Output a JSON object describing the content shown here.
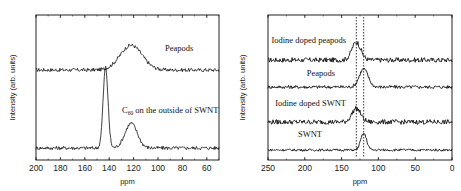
{
  "chart_data": [
    {
      "type": "line",
      "title": "",
      "xlabel": "ppm",
      "ylabel": "Intensity (arb. units)",
      "xlim": [
        200,
        50
      ],
      "x_reversed": true,
      "xticks": [
        200,
        180,
        160,
        140,
        120,
        100,
        80,
        60
      ],
      "xtick_labels": [
        "200",
        "180",
        "160",
        "140",
        "120",
        "100",
        "80",
        "60"
      ],
      "grid": false,
      "legend": "none (inline series labels)",
      "series": [
        {
          "name": "Peapods",
          "label": "Peapods",
          "offset": 1,
          "peaks": [
            {
              "ppm": 122,
              "height": 0.55,
              "width": 9
            }
          ],
          "noise": 0.05
        },
        {
          "name": "C60 on the outside of SWNT",
          "label_main": "C",
          "label_sub": "60",
          "label_rest": " on the outside of SWNT",
          "offset": 0,
          "peaks": [
            {
              "ppm": 143,
              "height": 1.8,
              "width": 2
            },
            {
              "ppm": 122,
              "height": 0.55,
              "width": 5
            }
          ],
          "noise": 0.05
        }
      ]
    },
    {
      "type": "line",
      "title": "",
      "xlabel": "ppm",
      "ylabel": "Intensity (arb. units)",
      "xlim": [
        250,
        0
      ],
      "x_reversed": true,
      "xticks": [
        250,
        200,
        150,
        100,
        50,
        0
      ],
      "xtick_labels": [
        "250",
        "200",
        "150",
        "100",
        "50",
        "0"
      ],
      "grid": false,
      "legend": "none (inline series labels)",
      "reference_lines": [
        {
          "ppm": 130,
          "style": "dotted"
        },
        {
          "ppm": 120,
          "style": "dotted"
        }
      ],
      "series": [
        {
          "name": "Iodine doped peapods",
          "label": "Iodine doped peapods",
          "offset": 3,
          "peaks": [
            {
              "ppm": 130,
              "height": 0.6,
              "width": 6
            }
          ],
          "noise": 0.1
        },
        {
          "name": "Peapods",
          "label": "Peapods",
          "offset": 2,
          "peaks": [
            {
              "ppm": 120,
              "height": 0.6,
              "width": 6
            }
          ],
          "noise": 0.07
        },
        {
          "name": "Iodine doped SWNT",
          "label": "Iodine doped SWNT",
          "offset": 1,
          "peaks": [
            {
              "ppm": 130,
              "height": 0.45,
              "width": 6
            }
          ],
          "noise": 0.1
        },
        {
          "name": "SWNT",
          "label": "SWNT",
          "offset": 0,
          "peaks": [
            {
              "ppm": 120,
              "height": 0.55,
              "width": 4
            }
          ],
          "noise": 0.05
        }
      ]
    }
  ]
}
